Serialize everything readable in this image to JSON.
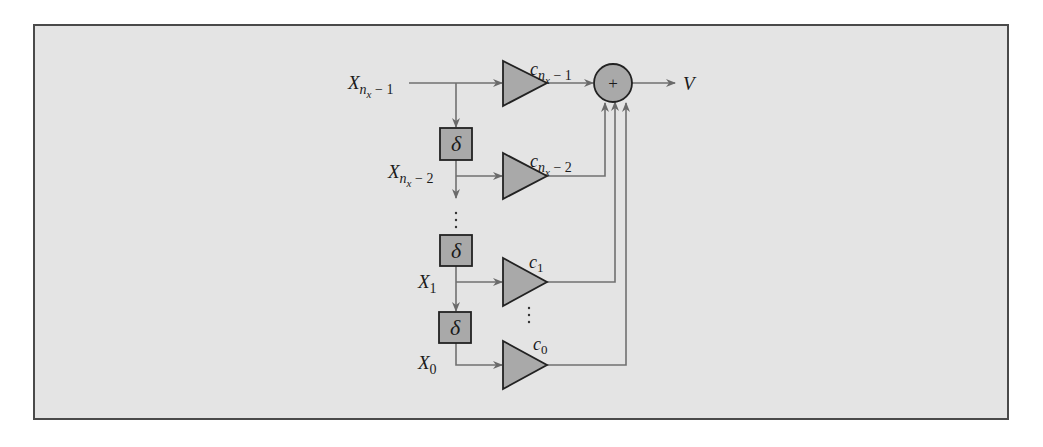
{
  "diagram": {
    "type": "FIR filter / tapped delay line block diagram",
    "inputs": [
      {
        "id": "x_nx_minus_1",
        "base": "X",
        "sub": "n",
        "subsub": "x",
        "suffix": " − 1"
      },
      {
        "id": "x_nx_minus_2",
        "base": "X",
        "sub": "n",
        "subsub": "x",
        "suffix": " − 2"
      },
      {
        "id": "x_1",
        "base": "X",
        "sub": "1"
      },
      {
        "id": "x_0",
        "base": "X",
        "sub": "0"
      }
    ],
    "gains": [
      {
        "id": "c_nx_minus_1",
        "base": "c",
        "sub": "n",
        "subsub": "x",
        "suffix": " − 1"
      },
      {
        "id": "c_nx_minus_2",
        "base": "c",
        "sub": "n",
        "subsub": "x",
        "suffix": " − 2"
      },
      {
        "id": "c_1",
        "base": "c",
        "sub": "1"
      },
      {
        "id": "c_0",
        "base": "c",
        "sub": "0"
      }
    ],
    "delay_symbol": "δ",
    "delay_count_visible": 3,
    "summer_symbol": "+",
    "output_label": "V",
    "ellipsis": "⋮",
    "colors": {
      "panel": "#e4e4e4",
      "frame_border": "#4a4a4a",
      "block_fill": "#a9a9a9",
      "block_stroke": "#222222",
      "wire": "#707070"
    }
  }
}
